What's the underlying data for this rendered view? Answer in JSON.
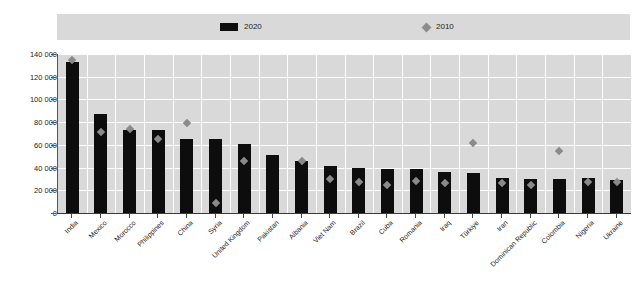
{
  "chart_data": {
    "type": "bar",
    "title": "",
    "subtitle": "",
    "xlabel": "",
    "ylabel": "",
    "ylim": [
      0,
      140000
    ],
    "ytick_values": [
      0,
      20000,
      40000,
      60000,
      80000,
      100000,
      120000,
      140000
    ],
    "ytick_labels": [
      "0",
      "20 000",
      "40 000",
      "60 000",
      "80 000",
      "100 000",
      "120 000",
      "140 000"
    ],
    "grid": true,
    "legend_position": "top",
    "categories": [
      "India",
      "Mexico",
      "Morocco",
      "Philippines",
      "China",
      "Syria",
      "United Kingdom",
      "Pakistan",
      "Albania",
      "Viet Nam",
      "Brazil",
      "Cuba",
      "Romania",
      "Iraq",
      "Türkiye",
      "Iran",
      "Dominican Republic",
      "Colombia",
      "Nigeria",
      "Ukraine"
    ],
    "series": [
      {
        "name": "2020",
        "marker": "bar",
        "color": "#0d0d0d",
        "values": [
          133000,
          87000,
          73000,
          73000,
          65000,
          65000,
          61000,
          51000,
          46000,
          41000,
          40000,
          39000,
          39000,
          36000,
          35000,
          31000,
          30000,
          30000,
          31000,
          29000
        ]
      },
      {
        "name": "2010",
        "marker": "diamond",
        "color": "#8a8a8a",
        "values": [
          135000,
          71000,
          74000,
          65000,
          79000,
          9000,
          46000,
          null,
          46000,
          30000,
          27000,
          25000,
          28000,
          26000,
          62000,
          26000,
          25000,
          55000,
          27000,
          27000
        ]
      }
    ]
  },
  "legend": {
    "items": [
      {
        "label": "2020",
        "type": "bar-swatch"
      },
      {
        "label": "2010",
        "type": "diamond-swatch"
      }
    ]
  },
  "colors": {
    "bar": "#0d0d0d",
    "marker": "#8a8a8a",
    "plot_background": "#d9d9d9",
    "page_background": "#ffffff",
    "gridline": "#ffffff",
    "axis": "#555555",
    "text": "#222222"
  }
}
